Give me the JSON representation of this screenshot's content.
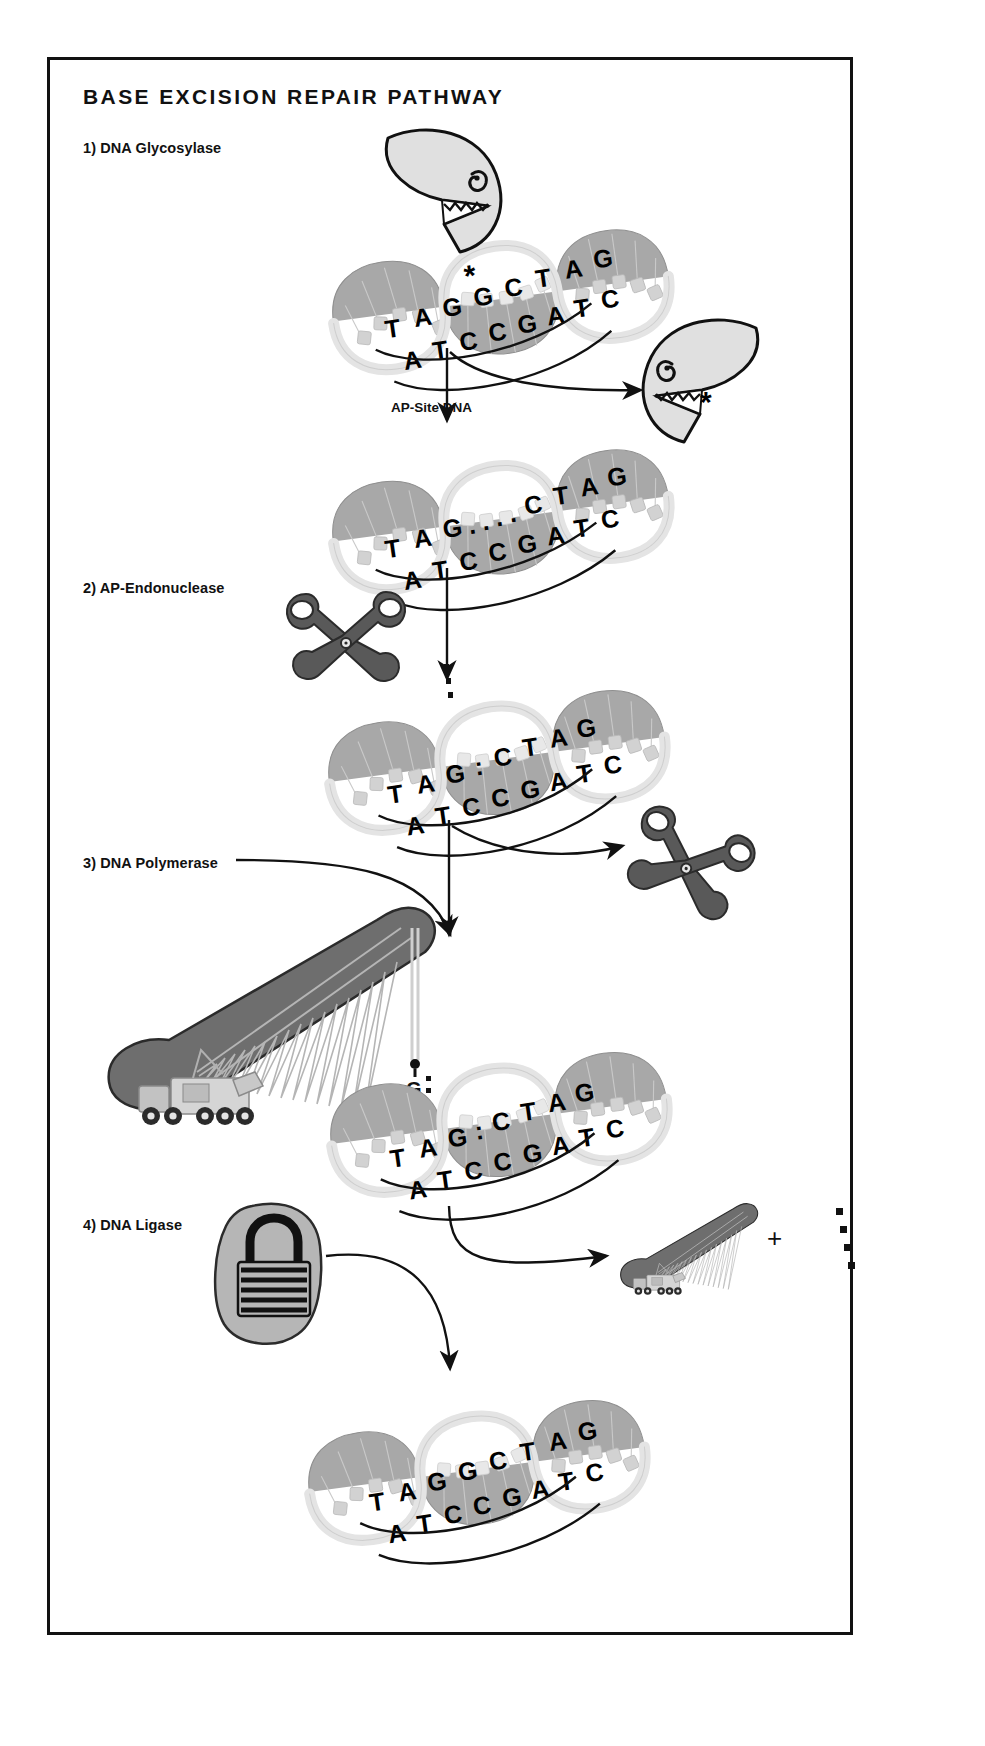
{
  "figure": {
    "title": "BASE EXCISION REPAIR PATHWAY",
    "domain": "biology-diagram",
    "frame_border_color": "#111111",
    "background_color": "#ffffff"
  },
  "steps": [
    {
      "id": "step1",
      "label": "1) DNA Glycosylase",
      "enzyme_icon": "pacman-glycosylase-icon"
    },
    {
      "id": "step2",
      "label": "2) AP-Endonuclease",
      "enzyme_icon": "scissors-icon"
    },
    {
      "id": "step3",
      "label": "3) DNA Polymerase",
      "enzyme_icon": "crane-icon"
    },
    {
      "id": "step4",
      "label": "4) DNA Ligase",
      "enzyme_icon": "padlock-icon"
    }
  ],
  "intermediate_labels": [
    {
      "id": "ap_site",
      "label": "AP-Site DNA"
    }
  ],
  "symbols": {
    "damaged_base_marker": "*",
    "plus": "+",
    "abasic_gap": "....",
    "nick": ":",
    "inserted_base": "G",
    "released_dots_count": 4
  },
  "dna_molecules": [
    {
      "id": "dna-damaged",
      "caption": "Damaged DNA with modified base",
      "top_strand": "TAGGCTAG",
      "bottom_strand": "ATCCGATC",
      "marker": "*",
      "marker_over_base_index": 3
    },
    {
      "id": "dna-ap-site",
      "caption": "AP-Site DNA",
      "top_strand": "TAG....CTAG",
      "bottom_strand": "ATCCGATC",
      "marker": ""
    },
    {
      "id": "dna-nicked",
      "caption": "Nicked AP-site DNA",
      "top_strand": "TAG:CTAG",
      "bottom_strand": "ATCCGATC",
      "marker": ":"
    },
    {
      "id": "dna-filling",
      "caption": "DNA with G being inserted by polymerase",
      "top_strand": "TAG:CTAG",
      "bottom_strand": "ATCCGATC",
      "marker": "G:"
    },
    {
      "id": "dna-repaired",
      "caption": "Repaired DNA",
      "top_strand": "TAGGCTAG",
      "bottom_strand": "ATCCGATC",
      "marker": ""
    }
  ],
  "dna_letters": {
    "damaged_top": [
      "T",
      "A",
      "G",
      "G",
      "C",
      "T",
      "A",
      "G"
    ],
    "damaged_bottom": [
      "A",
      "T",
      "C",
      "C",
      "G",
      "A",
      "T",
      "C"
    ],
    "ap_top": [
      "T",
      "A",
      "G",
      ".",
      ".",
      ".",
      ".",
      "C",
      "T",
      "A",
      "G"
    ],
    "ap_bottom": [
      "A",
      "T",
      "C",
      "C",
      "G",
      "A",
      "T",
      "C"
    ],
    "nicked_top": [
      "T",
      "A",
      "G",
      ":",
      "C",
      "T",
      "A",
      "G"
    ],
    "nicked_bottom": [
      "A",
      "T",
      "C",
      "C",
      "G",
      "A",
      "T",
      "C"
    ],
    "filling_top": [
      "T",
      "A",
      "G",
      ":",
      "C",
      "T",
      "A",
      "G"
    ],
    "filling_bottom": [
      "A",
      "T",
      "C",
      "C",
      "G",
      "A",
      "T",
      "C"
    ],
    "repaired_top": [
      "T",
      "A",
      "G",
      "G",
      "C",
      "T",
      "A",
      "G"
    ],
    "repaired_bottom": [
      "A",
      "T",
      "C",
      "C",
      "G",
      "A",
      "T",
      "C"
    ]
  },
  "colors": {
    "ink": "#111111",
    "enzyme_light": "#e0e0e0",
    "scissors_gray": "#595959",
    "crane_gray": "#6e6e6e",
    "lock_gray": "#b6b6b6",
    "helix_dark": "#a8a8a8",
    "helix_light": "#e4e4e4"
  }
}
